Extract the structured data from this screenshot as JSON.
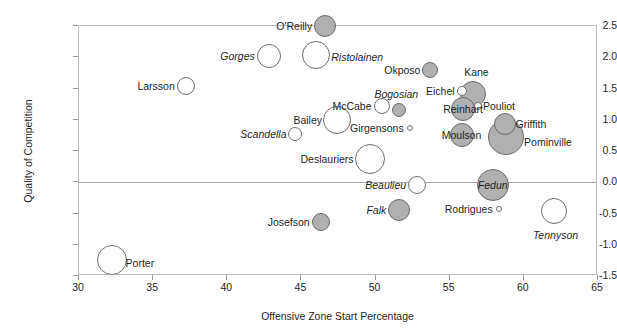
{
  "chart_data": {
    "type": "scatter",
    "title": "",
    "subtitle": "",
    "xlabel": "Offensive Zone Start Percentage",
    "ylabel": "Quality of Competition",
    "xlim": [
      30,
      65
    ],
    "ylim": [
      -1.5,
      2.5
    ],
    "xticks": [
      30,
      35,
      40,
      45,
      50,
      55,
      60,
      65
    ],
    "yticks": [
      2.5,
      2.0,
      1.5,
      1.0,
      0.5,
      0.0,
      -0.5,
      -1.0,
      -1.5
    ],
    "ytick_labels": [
      "2.5",
      "2.0",
      "1.5",
      "1.0",
      "0.5",
      "0.0",
      "-0.5",
      "-1.0",
      "-1.5"
    ],
    "xtick_labels": [
      "30",
      "35",
      "40",
      "45",
      "50",
      "55",
      "60",
      "65"
    ],
    "grid": false,
    "legend": "none",
    "zero_line": 0.0,
    "marker_encoding": {
      "size": "bubble radius encodes a third quantity (e.g. ice time)",
      "fill_gray": "#b0b0b0",
      "fill_open": "#ffffff",
      "stroke": "#6e6e6e"
    },
    "points": [
      {
        "label": "O'Reilly",
        "x": 46.6,
        "y": 2.5,
        "r": 11,
        "fill": "gray",
        "italic": false,
        "anchor": "end",
        "label_dx": -13,
        "label_dy": 0
      },
      {
        "label": "Ristolainen",
        "x": 46.0,
        "y": 2.04,
        "r": 14,
        "fill": "open",
        "italic": true,
        "anchor": "start",
        "label_dx": 15,
        "label_dy": 2
      },
      {
        "label": "Gorges",
        "x": 42.8,
        "y": 2.02,
        "r": 12,
        "fill": "open",
        "italic": true,
        "anchor": "end",
        "label_dx": -14,
        "label_dy": 0
      },
      {
        "label": "Okposo",
        "x": 53.7,
        "y": 1.8,
        "r": 8,
        "fill": "gray",
        "italic": false,
        "anchor": "end",
        "label_dx": -10,
        "label_dy": 0
      },
      {
        "label": "Larsson",
        "x": 37.2,
        "y": 1.54,
        "r": 9,
        "fill": "open",
        "italic": false,
        "anchor": "end",
        "label_dx": -11,
        "label_dy": 0
      },
      {
        "label": "Kane",
        "x": 56.6,
        "y": 1.42,
        "r": 13,
        "fill": "gray",
        "italic": false,
        "anchor": "mid",
        "label_dx": 3,
        "label_dy": -22
      },
      {
        "label": "Eichel",
        "x": 55.8,
        "y": 1.46,
        "r": 5,
        "fill": "open",
        "italic": false,
        "anchor": "end",
        "label_dx": -7,
        "label_dy": 0
      },
      {
        "label": "Bogosian",
        "x": 51.6,
        "y": 1.15,
        "r": 7,
        "fill": "gray",
        "italic": true,
        "anchor": "mid",
        "label_dx": -3,
        "label_dy": -16
      },
      {
        "label": "Pouliot",
        "x": 56.9,
        "y": 1.22,
        "r": 4,
        "fill": "open",
        "italic": false,
        "anchor": "start",
        "label_dx": 5,
        "label_dy": 0
      },
      {
        "label": "Reinhart",
        "x": 55.9,
        "y": 1.18,
        "r": 12,
        "fill": "gray",
        "italic": false,
        "anchor": "mid",
        "label_dx": 0,
        "label_dy": 0
      },
      {
        "label": "McCabe",
        "x": 50.4,
        "y": 1.22,
        "r": 8,
        "fill": "open",
        "italic": false,
        "anchor": "end",
        "label_dx": -10,
        "label_dy": 0
      },
      {
        "label": "Bailey",
        "x": 47.4,
        "y": 1.0,
        "r": 14,
        "fill": "open",
        "italic": false,
        "anchor": "end",
        "label_dx": -15,
        "label_dy": 0
      },
      {
        "label": "Girgensons",
        "x": 52.3,
        "y": 0.87,
        "r": 3,
        "fill": "open",
        "italic": false,
        "anchor": "end",
        "label_dx": -6,
        "label_dy": 0
      },
      {
        "label": "Scandella",
        "x": 44.6,
        "y": 0.77,
        "r": 7,
        "fill": "open",
        "italic": true,
        "anchor": "end",
        "label_dx": -9,
        "label_dy": 0
      },
      {
        "label": "Griffith",
        "x": 58.7,
        "y": 0.93,
        "r": 11,
        "fill": "gray",
        "italic": false,
        "anchor": "start",
        "label_dx": 11,
        "label_dy": 0
      },
      {
        "label": "Pominville",
        "x": 58.8,
        "y": 0.72,
        "r": 18,
        "fill": "gray",
        "italic": false,
        "anchor": "start",
        "label_dx": 18,
        "label_dy": 5
      },
      {
        "label": "Moulson",
        "x": 55.8,
        "y": 0.76,
        "r": 12,
        "fill": "gray",
        "italic": false,
        "anchor": "mid",
        "label_dx": 0,
        "label_dy": 0
      },
      {
        "label": "Deslauriers",
        "x": 49.6,
        "y": 0.38,
        "r": 15,
        "fill": "open",
        "italic": false,
        "anchor": "end",
        "label_dx": -16,
        "label_dy": 0
      },
      {
        "label": "Fedun",
        "x": 57.9,
        "y": -0.05,
        "r": 16,
        "fill": "gray",
        "italic": true,
        "anchor": "mid",
        "label_dx": 0,
        "label_dy": 0
      },
      {
        "label": "Beaulieu",
        "x": 52.8,
        "y": -0.04,
        "r": 9,
        "fill": "open",
        "italic": true,
        "anchor": "end",
        "label_dx": -11,
        "label_dy": 0
      },
      {
        "label": "Rodrigues",
        "x": 58.3,
        "y": -0.42,
        "r": 3,
        "fill": "open",
        "italic": false,
        "anchor": "end",
        "label_dx": -6,
        "label_dy": 0
      },
      {
        "label": "Falk",
        "x": 51.6,
        "y": -0.44,
        "r": 11,
        "fill": "gray",
        "italic": true,
        "anchor": "end",
        "label_dx": -13,
        "label_dy": 0
      },
      {
        "label": "Tennyson",
        "x": 62.0,
        "y": -0.46,
        "r": 13,
        "fill": "open",
        "italic": true,
        "anchor": "mid",
        "label_dx": 2,
        "label_dy": 24
      },
      {
        "label": "Josefson",
        "x": 46.3,
        "y": -0.64,
        "r": 9,
        "fill": "gray",
        "italic": false,
        "anchor": "end",
        "label_dx": -11,
        "label_dy": 0
      },
      {
        "label": "Porter",
        "x": 32.2,
        "y": -1.24,
        "r": 15,
        "fill": "open",
        "italic": false,
        "anchor": "start",
        "label_dx": 14,
        "label_dy": 3
      }
    ]
  }
}
